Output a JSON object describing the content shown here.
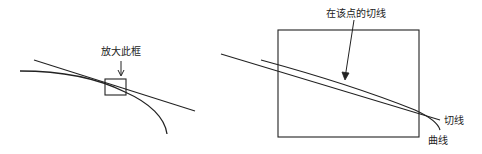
{
  "diagram": {
    "left_panel": {
      "zoom_label": "放大此框"
    },
    "right_panel": {
      "tangent_point_label": "在该点的切线",
      "tangent_label": "切线",
      "curve_label": "曲线"
    },
    "colors": {
      "stroke": "#222222",
      "background": "#ffffff"
    }
  }
}
